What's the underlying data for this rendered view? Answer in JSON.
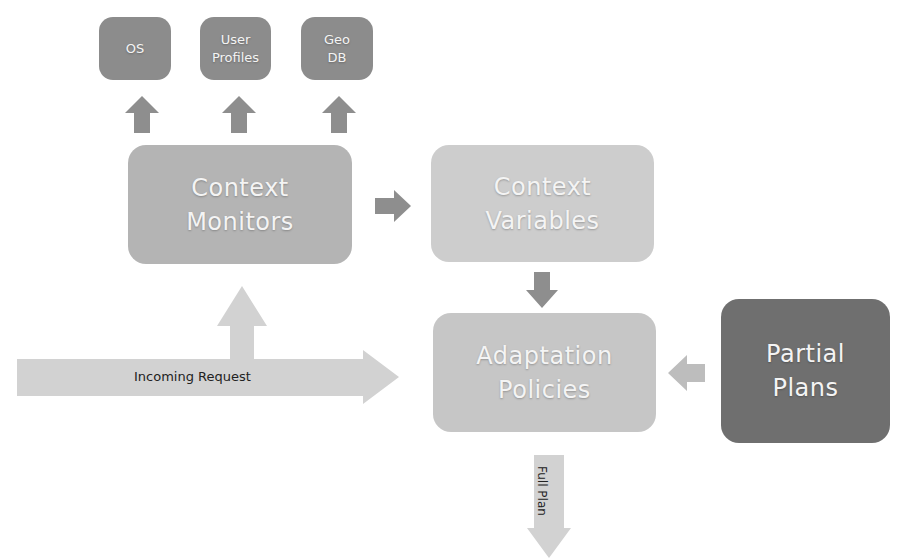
{
  "diagram": {
    "sources": [
      {
        "id": "os",
        "label": "OS"
      },
      {
        "id": "user-profiles",
        "label": "User\nProfiles"
      },
      {
        "id": "geo-db",
        "label": "Geo\nDB"
      }
    ],
    "nodes": {
      "context_monitors": "Context\nMonitors",
      "context_variables": "Context\nVariables",
      "adaptation_policies": "Adaptation\nPolicies",
      "partial_plans": "Partial\nPlans"
    },
    "arrows": {
      "incoming_request": "Incoming Request",
      "full_plan": "Full Plan"
    },
    "colors": {
      "source_box": "#8c8c8c",
      "monitors_box": "#b4b4b4",
      "variables_box": "#cdcdcd",
      "policies_box": "#c6c6c6",
      "partial_plans_box": "#6f6f6f",
      "dark_arrow": "#8e8e8e",
      "light_arrow": "#d2d2d2"
    }
  }
}
